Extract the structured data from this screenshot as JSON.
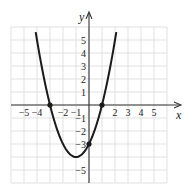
{
  "chart_data": {
    "type": "line",
    "title": "",
    "xlabel": "x",
    "ylabel": "y",
    "xlim": [
      -6,
      6
    ],
    "ylim": [
      -6,
      6
    ],
    "grid": true,
    "x_tick_labels": [
      "-5",
      "-4",
      "-2",
      "-1",
      "2",
      "3",
      "4",
      "5"
    ],
    "x_tick_values": [
      -5,
      -4,
      -2,
      -1,
      2,
      3,
      4,
      5
    ],
    "y_tick_labels": [
      "5",
      "4",
      "3",
      "2",
      "1",
      "-1",
      "-2",
      "-3",
      "-5"
    ],
    "y_tick_values": [
      5,
      4,
      3,
      2,
      1,
      -1,
      -2,
      -3,
      -5
    ],
    "series": [
      {
        "name": "parabola",
        "equation": "y = x^2 + 2x - 3",
        "x": [
          -4.1,
          -4,
          -3,
          -2,
          -1,
          0,
          1,
          2,
          2.1
        ],
        "y": [
          5.61,
          5,
          0,
          -3,
          -4,
          -3,
          0,
          5,
          5.61
        ]
      }
    ],
    "marked_points": [
      {
        "x": -3,
        "y": 0
      },
      {
        "x": 1,
        "y": 0
      },
      {
        "x": 0,
        "y": -3
      }
    ]
  },
  "labels": {
    "x_axis": "x",
    "y_axis": "y"
  }
}
